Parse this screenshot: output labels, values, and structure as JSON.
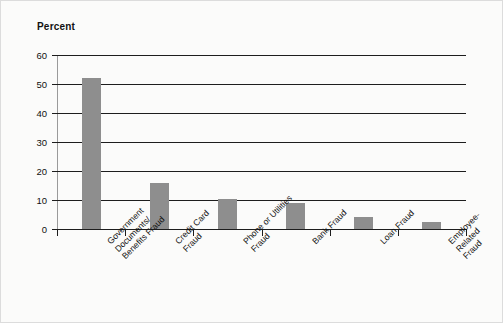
{
  "chart_data": {
    "type": "bar",
    "title": "",
    "xlabel": "",
    "ylabel": "Percent",
    "ylim": [
      0,
      60
    ],
    "yticks": [
      0,
      10,
      20,
      30,
      40,
      50,
      60
    ],
    "grid": true,
    "legend": "none",
    "categories": [
      "Government Documents/ Benefits Fraud",
      "Credit Card Fraud",
      "Phone or Utilities Fraud",
      "Bank Fraud",
      "Loan Fraud",
      "Employee- Related Fraud"
    ],
    "category_lines": [
      [
        "Government",
        "Documents/",
        "Benefits Fraud"
      ],
      [
        "Credit Card",
        "Fraud"
      ],
      [
        "Phone or Utilities",
        "Fraud"
      ],
      [
        "Bank Fraud"
      ],
      [
        "Loan Fraud"
      ],
      [
        "Employee-",
        "Related",
        "Fraud"
      ]
    ],
    "values": [
      52,
      16,
      10.5,
      9,
      4,
      2.5
    ],
    "bar_color": "#8e8e8e",
    "axis_color": "#1d1d1d",
    "background_color": "#fbfbfa"
  },
  "axis": {
    "y_title": "Percent",
    "tick_labels": [
      "0",
      "10",
      "20",
      "30",
      "40",
      "50",
      "60"
    ]
  }
}
